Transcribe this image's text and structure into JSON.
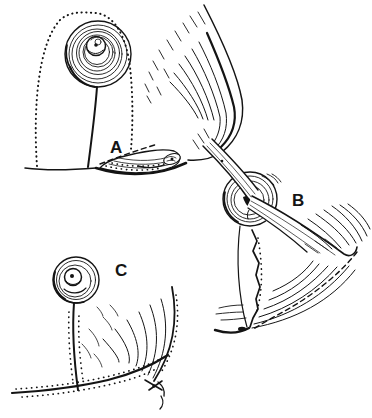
{
  "figure": {
    "panels": [
      {
        "label": "A"
      },
      {
        "label": "B"
      },
      {
        "label": "C"
      }
    ],
    "colors": {
      "ink": "#141414",
      "background": "#ffffff"
    }
  }
}
